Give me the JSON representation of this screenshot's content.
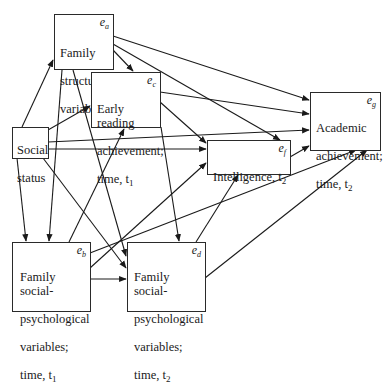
{
  "diagram": {
    "type": "path-diagram",
    "nodes": [
      {
        "id": "family_structure",
        "lines": [
          "Family",
          "structure",
          "variables"
        ],
        "error_term": "e",
        "error_sub": "a"
      },
      {
        "id": "early_reading",
        "lines": [
          "Early reading",
          "achievement;",
          "time, t"
        ],
        "time_sub": "1",
        "error_term": "e",
        "error_sub": "c"
      },
      {
        "id": "social_status",
        "lines": [
          "Social",
          "status"
        ]
      },
      {
        "id": "intelligence",
        "lines": [
          "Intelligence, t"
        ],
        "time_sub": "2",
        "error_term": "e",
        "error_sub": "f"
      },
      {
        "id": "academic",
        "lines": [
          "Academic",
          "achievement;",
          "time, t"
        ],
        "time_sub": "2",
        "error_term": "e",
        "error_sub": "g"
      },
      {
        "id": "fsp_t1",
        "lines": [
          "Family social-",
          "psychological",
          "variables;",
          "time, t"
        ],
        "time_sub": "1",
        "error_term": "e",
        "error_sub": "b"
      },
      {
        "id": "fsp_t2",
        "lines": [
          "Family social-",
          "psychological",
          "variables;",
          "time, t"
        ],
        "time_sub": "2",
        "error_term": "e",
        "error_sub": "d"
      }
    ],
    "edges": [
      {
        "from": "social_status",
        "to": "family_structure"
      },
      {
        "from": "social_status",
        "to": "early_reading"
      },
      {
        "from": "social_status",
        "to": "intelligence"
      },
      {
        "from": "social_status",
        "to": "academic"
      },
      {
        "from": "social_status",
        "to": "fsp_t1"
      },
      {
        "from": "social_status",
        "to": "fsp_t2"
      },
      {
        "from": "family_structure",
        "to": "early_reading"
      },
      {
        "from": "family_structure",
        "to": "intelligence"
      },
      {
        "from": "family_structure",
        "to": "academic"
      },
      {
        "from": "family_structure",
        "to": "fsp_t1"
      },
      {
        "from": "family_structure",
        "to": "fsp_t2"
      },
      {
        "from": "early_reading",
        "to": "intelligence"
      },
      {
        "from": "early_reading",
        "to": "academic"
      },
      {
        "from": "early_reading",
        "to": "fsp_t2"
      },
      {
        "from": "fsp_t1",
        "to": "early_reading"
      },
      {
        "from": "fsp_t1",
        "to": "fsp_t2"
      },
      {
        "from": "fsp_t1",
        "to": "intelligence"
      },
      {
        "from": "fsp_t1",
        "to": "academic"
      },
      {
        "from": "fsp_t2",
        "to": "intelligence"
      },
      {
        "from": "fsp_t2",
        "to": "academic"
      },
      {
        "from": "intelligence",
        "to": "academic"
      }
    ]
  },
  "colors": {
    "line": "#1a1a1a",
    "background": "#ffffff"
  }
}
